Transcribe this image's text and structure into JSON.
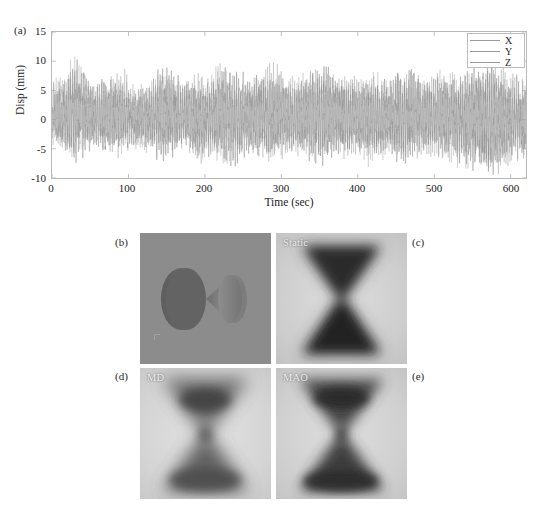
{
  "figure": {
    "panel_tags": {
      "a": "(a)",
      "b": "(b)",
      "c": "(c)",
      "d": "(d)",
      "e": "(e)"
    }
  },
  "chart_data": {
    "type": "line",
    "title": "",
    "xlabel": "Time (sec)",
    "ylabel": "Disp (mm)",
    "xlim": [
      0,
      620
    ],
    "ylim": [
      -10,
      15
    ],
    "xticks": [
      0,
      100,
      200,
      300,
      400,
      500,
      600
    ],
    "yticks": [
      15,
      10,
      5,
      0,
      -5,
      -10
    ],
    "xtick_labels": [
      "0",
      "100",
      "200",
      "300",
      "400",
      "500",
      "600"
    ],
    "ytick_labels": [
      "15",
      "10",
      "5",
      "0",
      "-5",
      "-10"
    ],
    "grid": false,
    "legend_position": "upper-right",
    "series": [
      {
        "name": "X",
        "color": "#9a9a9a",
        "description": "Rapidly oscillating displacement trace, dominant band roughly -5 to +7 mm with intermittent bursts peaking near +13 mm and troughs near -9 mm",
        "envelope_max": [
          7.5,
          9.0,
          13.2,
          8.0,
          7.2,
          8.5,
          9.8,
          7.0,
          6.5,
          10.8,
          9.2,
          7.4,
          6.8,
          8.0,
          11.2,
          9.0,
          7.6,
          8.2,
          10.2,
          9.4,
          7.8,
          8.6,
          10.9,
          9.2,
          7.4,
          8.0,
          9.4,
          8.2,
          7.0,
          9.3,
          8.8,
          7.6,
          9.2,
          8.4,
          7.2,
          8.8,
          9.6,
          8.0,
          6.8,
          7.4
        ],
        "envelope_min": [
          -3.0,
          -3.6,
          -4.2,
          -3.4,
          -3.8,
          -4.6,
          -4.0,
          -3.2,
          -4.4,
          -5.0,
          -4.2,
          -3.6,
          -6.6,
          -5.4,
          -4.8,
          -6.8,
          -5.2,
          -4.4,
          -5.6,
          -4.8,
          -4.2,
          -5.0,
          -6.0,
          -4.6,
          -5.4,
          -4.0,
          -5.8,
          -4.8,
          -5.2,
          -6.4,
          -5.0,
          -4.4,
          -5.6,
          -6.0,
          -8.4,
          -7.2,
          -9.0,
          -7.8,
          -6.4,
          -7.0
        ]
      },
      {
        "name": "Y",
        "color": "#a6a6a6",
        "description": "Overlapping trace of similar amplitude, largely hidden beneath X"
      },
      {
        "name": "Z",
        "color": "#8f8f8f",
        "description": "Overlapping trace of similar amplitude, largely hidden beneath X"
      }
    ],
    "legend_entries": [
      "X",
      "Y",
      "Z"
    ]
  },
  "panels": {
    "b": {
      "tag": "(b)",
      "inner_label": "",
      "kind": "3d-render",
      "description": "Two cones joined tip-to-tip rendered on a flat gray background",
      "background": "#8c8c8c"
    },
    "c": {
      "tag": "(c)",
      "inner_label": "Static",
      "kind": "grayscale-projection",
      "description": "Blurred dark hourglass / bowtie shape on light gray field",
      "background": "#d0d0d0"
    },
    "d": {
      "tag": "(d)",
      "inner_label": "MD",
      "kind": "grayscale-projection",
      "description": "Blurred lighter hourglass / bowtie shape on light gray field",
      "background": "#d6d6d6"
    },
    "e": {
      "tag": "(e)",
      "inner_label": "MAO",
      "kind": "grayscale-projection",
      "description": "Blurred dark hourglass / bowtie shape on light gray field",
      "background": "#d2d2d2"
    }
  }
}
